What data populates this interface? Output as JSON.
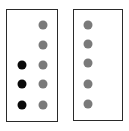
{
  "diagram": {
    "title": "",
    "colors": {
      "border": "#2a2a2a",
      "gray_dot": "#7a7a7a",
      "black_dot": "#0a0a0a",
      "background": "#ffffff"
    },
    "panels": [
      {
        "id": "left",
        "box": {
          "x": 6,
          "y": 9,
          "w": 52,
          "h": 113
        },
        "dots": [
          {
            "x": 43,
            "y": 25,
            "color": "gray"
          },
          {
            "x": 43,
            "y": 45,
            "color": "gray"
          },
          {
            "x": 43,
            "y": 65,
            "color": "gray"
          },
          {
            "x": 43,
            "y": 84,
            "color": "gray"
          },
          {
            "x": 43,
            "y": 105,
            "color": "gray"
          },
          {
            "x": 22,
            "y": 65,
            "color": "black"
          },
          {
            "x": 22,
            "y": 84,
            "color": "black"
          },
          {
            "x": 22,
            "y": 105,
            "color": "black"
          }
        ],
        "counts": {
          "gray": 5,
          "black": 3
        }
      },
      {
        "id": "right",
        "box": {
          "x": 73,
          "y": 9,
          "w": 50,
          "h": 112
        },
        "dots": [
          {
            "x": 88,
            "y": 25,
            "color": "gray"
          },
          {
            "x": 88,
            "y": 44,
            "color": "gray"
          },
          {
            "x": 88,
            "y": 63,
            "color": "gray"
          },
          {
            "x": 88,
            "y": 84,
            "color": "gray"
          },
          {
            "x": 88,
            "y": 104,
            "color": "gray"
          }
        ],
        "counts": {
          "gray": 5,
          "black": 0
        }
      }
    ]
  }
}
